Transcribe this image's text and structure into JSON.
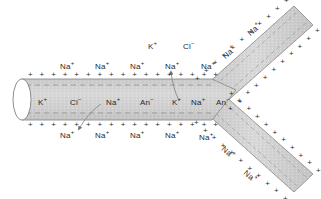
{
  "figure": {
    "background_color": "#ffffff",
    "cytoplasm_color": "#d2d2d2",
    "membrane_color": "#8c8c8c",
    "text_color": "#2a2a2a"
  },
  "ions": {
    "sodium": "Na",
    "potassium": "K",
    "chloride": "Cl",
    "anion": "An",
    "plus": "+",
    "minus": "−"
  },
  "extracellular_top": [
    {
      "ion": "Na",
      "charge": "+",
      "x": 60,
      "y": 62
    },
    {
      "ion": "Na",
      "charge": "+",
      "x": 95,
      "y": 62
    },
    {
      "ion": "Na",
      "charge": "+",
      "x": 130,
      "y": 62
    },
    {
      "ion": "Na",
      "charge": "+",
      "x": 165,
      "y": 62
    },
    {
      "ion": "Na",
      "charge": "+",
      "x": 201,
      "y": 62
    }
  ],
  "extracellular_upper_far": [
    {
      "ion": "K",
      "charge": "+",
      "x": 148,
      "y": 42
    },
    {
      "ion": "Cl",
      "charge": "−",
      "x": 183,
      "y": 42
    }
  ],
  "extracellular_bottom": [
    {
      "ion": "Na",
      "charge": "+",
      "x": 60,
      "y": 131
    },
    {
      "ion": "Na",
      "charge": "+",
      "x": 95,
      "y": 131
    },
    {
      "ion": "Na",
      "charge": "+",
      "x": 130,
      "y": 131
    },
    {
      "ion": "Na",
      "charge": "+",
      "x": 165,
      "y": 131
    },
    {
      "ion": "Na",
      "charge": "+",
      "x": 199,
      "y": 133
    }
  ],
  "intracellular": [
    {
      "ion": "K",
      "charge": "+",
      "x": 38,
      "y": 98
    },
    {
      "ion": "Cl",
      "charge": "−",
      "x": 70,
      "y": 98
    },
    {
      "ion": "Na",
      "charge": "+",
      "x": 106,
      "y": 98
    },
    {
      "ion": "An",
      "charge": "−",
      "x": 140,
      "y": 98
    },
    {
      "ion": "K",
      "charge": "+",
      "x": 172,
      "y": 98
    },
    {
      "ion": "Na",
      "charge": "+",
      "x": 191,
      "y": 98
    },
    {
      "ion": "An",
      "charge": "−",
      "x": 216,
      "y": 98
    }
  ],
  "branch_upper_labels": [
    {
      "ion": "Na",
      "charge": "+",
      "x": 222,
      "y": 48,
      "rotation": -42
    },
    {
      "ion": "Na",
      "charge": "+",
      "x": 247,
      "y": 25,
      "rotation": -42
    }
  ],
  "branch_lower_labels": [
    {
      "ion": "Na",
      "charge": "+",
      "x": 221,
      "y": 148,
      "rotation": 40
    },
    {
      "ion": "Na",
      "charge": "+",
      "x": 243,
      "y": 172,
      "rotation": 40
    }
  ],
  "arrows": [
    {
      "name": "sodium-influx-arrow",
      "direction": "inward-down",
      "from_x": 101,
      "from_y": 106,
      "to_x": 78,
      "to_y": 130
    },
    {
      "name": "sodium-efflux-arrow",
      "direction": "outward-up",
      "from_x": 178,
      "from_y": 100,
      "to_x": 172,
      "to_y": 71
    }
  ],
  "membrane_charges": {
    "outer_sign": "+",
    "inner_sign": "−",
    "description": "Outer membrane surface positive, inner surface negative"
  }
}
